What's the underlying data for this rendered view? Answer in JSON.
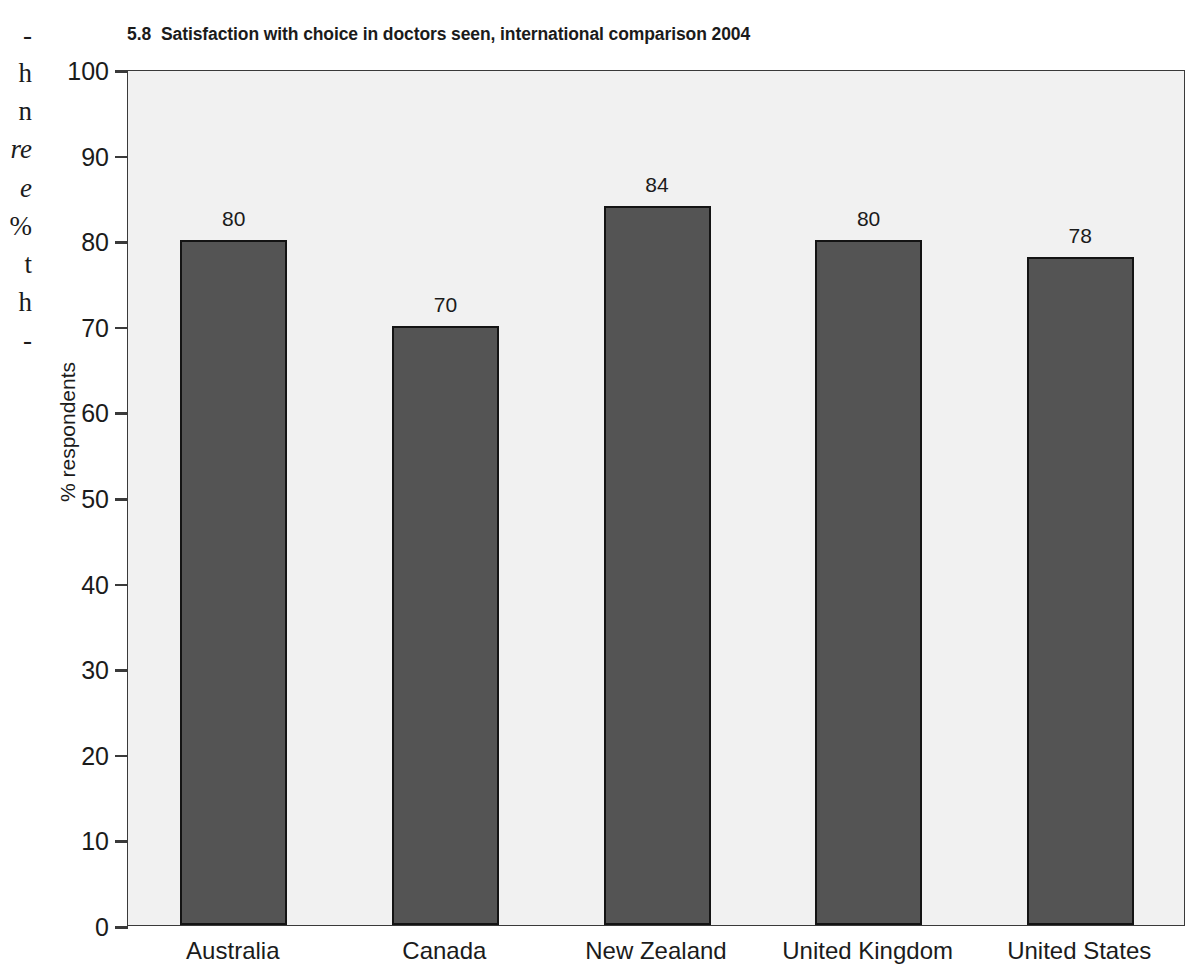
{
  "page": {
    "background": "#ffffff",
    "width": 1204,
    "height": 957
  },
  "margin_text": {
    "description": "cut-off serif body-text column at left page edge",
    "fragments": [
      {
        "text": "-",
        "italic": false,
        "top": 22
      },
      {
        "text": "h",
        "italic": false,
        "top": 60
      },
      {
        "text": "n",
        "italic": false,
        "top": 98
      },
      {
        "text": "re",
        "italic": true,
        "top": 136
      },
      {
        "text": "e",
        "italic": true,
        "top": 175
      },
      {
        "text": "%",
        "italic": false,
        "top": 213
      },
      {
        "text": "t",
        "italic": false,
        "top": 251
      },
      {
        "text": "h",
        "italic": false,
        "top": 289
      },
      {
        "text": "-",
        "italic": false,
        "top": 327
      }
    ]
  },
  "figure": {
    "number": "5.8",
    "title": "Satisfaction with choice in doctors seen, international comparison 2004"
  },
  "chart_data": {
    "type": "bar",
    "categories": [
      "Australia",
      "Canada",
      "New Zealand",
      "United Kingdom",
      "United States"
    ],
    "values": [
      80,
      70,
      84,
      80,
      78
    ],
    "value_labels": [
      "80",
      "70",
      "84",
      "80",
      "78"
    ],
    "xlabel": "",
    "ylabel": "% respondents",
    "ylim": [
      0,
      100
    ],
    "ytick_step": 10,
    "yticks": [
      0,
      10,
      20,
      30,
      40,
      50,
      60,
      70,
      80,
      90,
      100
    ],
    "ytick_labels": [
      "0",
      "10",
      "20",
      "30",
      "40",
      "50",
      "60",
      "70",
      "80",
      "90",
      "100"
    ],
    "grid": false,
    "legend": null,
    "orientation": "vertical",
    "colors": {
      "bar_fill": "#545454",
      "bar_border": "#141414",
      "plot_background": "#f1f1f1",
      "axis": "#3a3a3a",
      "text": "#1b1b1b",
      "page_background": "#ffffff"
    }
  }
}
